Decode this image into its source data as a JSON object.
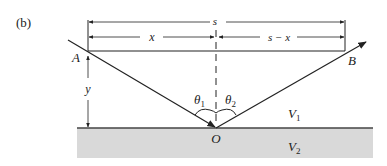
{
  "figure": {
    "panel_label": "(b)",
    "labels": {
      "s": "s",
      "x": "x",
      "s_minus_x": "s − x",
      "y": "y",
      "A": "A",
      "B": "B",
      "O": "O",
      "theta1": "θ",
      "theta1_sub": "1",
      "theta2": "θ",
      "theta2_sub": "2",
      "V1": "V",
      "V1_sub": "1",
      "V2": "V",
      "V2_sub": "2"
    },
    "colors": {
      "line": "#222222",
      "ground_fill": "#d9d9d9",
      "ground_line": "#444444"
    }
  }
}
